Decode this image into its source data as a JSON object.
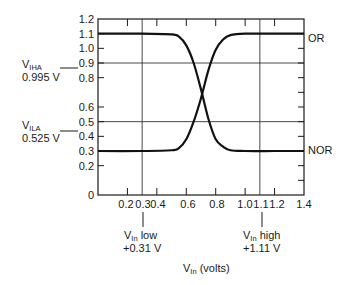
{
  "chart_data": {
    "type": "line",
    "title": "",
    "xlabel": "V_in (volts)",
    "ylabel": "",
    "xlim": [
      0,
      1.4
    ],
    "ylim": [
      0,
      1.2
    ],
    "grid": false,
    "x_tick_labels": [
      "0.2",
      "0.3",
      "0.4",
      "0.6",
      "0.8",
      "1.0",
      "1.1",
      "1.2",
      "1.4"
    ],
    "x_tick_values": [
      0.2,
      0.3,
      0.4,
      0.6,
      0.8,
      1.0,
      1.1,
      1.2,
      1.4
    ],
    "y_tick_labels": [
      "0",
      "0.2",
      "0.3",
      "0.4",
      "0.5",
      "0.6",
      "0.8",
      "0.9",
      "1.0",
      "1.1",
      "1.2"
    ],
    "y_tick_values": [
      0,
      0.2,
      0.3,
      0.4,
      0.5,
      0.6,
      0.8,
      0.9,
      1.0,
      1.1,
      1.2
    ],
    "series": [
      {
        "name": "OR",
        "x": [
          0.0,
          0.3,
          0.5,
          0.55,
          0.6,
          0.65,
          0.7,
          0.75,
          0.8,
          0.85,
          0.9,
          1.0,
          1.2,
          1.4
        ],
        "y": [
          0.3,
          0.3,
          0.305,
          0.32,
          0.38,
          0.5,
          0.66,
          0.85,
          0.99,
          1.06,
          1.09,
          1.1,
          1.1,
          1.1
        ]
      },
      {
        "name": "NOR",
        "x": [
          0.0,
          0.3,
          0.5,
          0.55,
          0.6,
          0.65,
          0.7,
          0.75,
          0.8,
          0.85,
          0.9,
          1.0,
          1.2,
          1.4
        ],
        "y": [
          1.1,
          1.1,
          1.095,
          1.08,
          1.02,
          0.9,
          0.72,
          0.52,
          0.38,
          0.33,
          0.305,
          0.3,
          0.3,
          0.3
        ]
      }
    ],
    "reference_lines": [
      {
        "axis": "y",
        "value": 0.9,
        "label": "V_IHA",
        "value_label": "0.995 V"
      },
      {
        "axis": "y",
        "value": 0.5,
        "label": "V_ILA",
        "value_label": "0.525 V"
      },
      {
        "axis": "x",
        "value": 0.31,
        "label": "V_in low",
        "value_label": "+0.31 V"
      },
      {
        "axis": "x",
        "value": 1.11,
        "label": "V_in high",
        "value_label": "+1.11 V"
      }
    ],
    "annotations": [
      "OR",
      "NOR"
    ]
  },
  "labels": {
    "or": "OR",
    "nor": "NOR",
    "viha_main": "V",
    "viha_sub": "IHA",
    "viha_value": "0.995 V",
    "vila_main": "V",
    "vila_sub": "ILA",
    "vila_value": "0.525 V",
    "vin_low_main": "V",
    "vin_low_sub": "In",
    "vin_low_word": " low",
    "vin_low_value": "+0.31 V",
    "vin_high_main": "V",
    "vin_high_sub": "In",
    "vin_high_word": " high",
    "vin_high_value": "+1.11 V",
    "xaxis_main": "V",
    "xaxis_sub": "In",
    "xaxis_unit": " (volts)"
  }
}
